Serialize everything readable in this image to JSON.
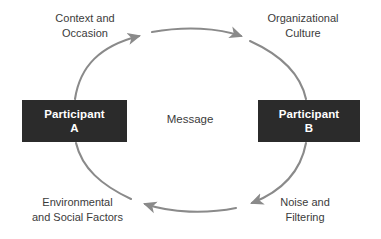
{
  "diagram": {
    "type": "cycle-diagram",
    "colors": {
      "background": "#ffffff",
      "box_fill": "#2b2b2b",
      "box_text": "#ffffff",
      "arrow": "#8a8a8a",
      "label_text": "#3b3b3b"
    },
    "nodes": [
      {
        "id": "participant-a",
        "line1": "Participant",
        "line2": "A"
      },
      {
        "id": "participant-b",
        "line1": "Participant",
        "line2": "B"
      }
    ],
    "center_label": "Message",
    "labels": [
      {
        "id": "context-occasion",
        "line1": "Context and",
        "line2": "Occasion",
        "position": "top-left"
      },
      {
        "id": "organizational-culture",
        "line1": "Organizational",
        "line2": "Culture",
        "position": "top-right"
      },
      {
        "id": "environmental-social-factors",
        "line1": "Environmental",
        "line2": "and Social Factors",
        "position": "bottom-left"
      },
      {
        "id": "noise-filtering",
        "line1": "Noise and",
        "line2": "Filtering",
        "position": "bottom-right"
      }
    ],
    "arrows": [
      {
        "id": "arrow-a-to-top",
        "from": "participant-a",
        "to": "top-arc",
        "direction": "clockwise"
      },
      {
        "id": "arrow-top-to-b",
        "from": "top-arc",
        "to": "participant-b",
        "direction": "clockwise"
      },
      {
        "id": "arrow-b-to-bottom",
        "from": "participant-b",
        "to": "bottom-arc",
        "direction": "clockwise"
      },
      {
        "id": "arrow-bottom-to-a",
        "from": "bottom-arc",
        "to": "participant-a",
        "direction": "clockwise"
      }
    ]
  }
}
